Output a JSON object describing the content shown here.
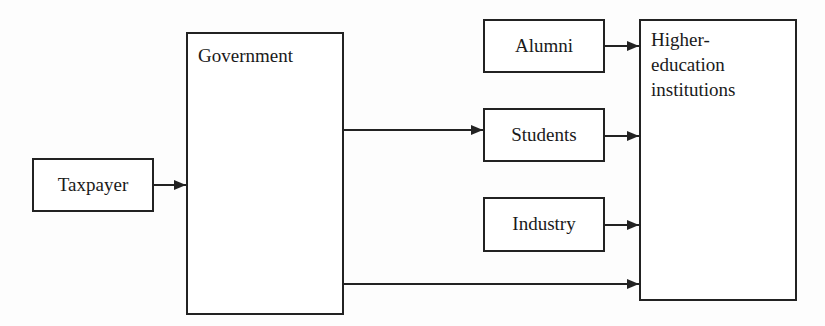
{
  "diagram": {
    "type": "flow",
    "nodes": {
      "taxpayer": {
        "label": "Taxpayer"
      },
      "government": {
        "label": "Government"
      },
      "alumni": {
        "label": "Alumni"
      },
      "students": {
        "label": "Students"
      },
      "industry": {
        "label": "Industry"
      },
      "hei": {
        "label_lines": [
          "Higher-",
          "education",
          "institutions"
        ]
      }
    },
    "edges": [
      {
        "from": "Taxpayer",
        "to": "Government"
      },
      {
        "from": "Government",
        "to": "Students"
      },
      {
        "from": "Government",
        "to": "Higher-education institutions"
      },
      {
        "from": "Alumni",
        "to": "Higher-education institutions"
      },
      {
        "from": "Students",
        "to": "Higher-education institutions"
      },
      {
        "from": "Industry",
        "to": "Higher-education institutions"
      }
    ],
    "colors": {
      "stroke": "#222222",
      "background": "#fdfdfd"
    }
  }
}
